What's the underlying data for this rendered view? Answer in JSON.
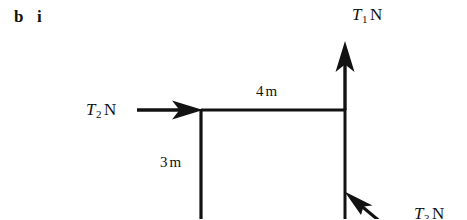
{
  "figure": {
    "part_label": {
      "part": "b",
      "roman": "i"
    },
    "background_color": "#ffffff",
    "ink_color": "#121212",
    "forces": [
      {
        "name": "T1",
        "symbol": "T",
        "subscript": "1",
        "unit": "N",
        "direction": "up",
        "arrow": {
          "x1": 345,
          "y1": 110,
          "x2": 345,
          "y2": 44
        },
        "label_position": {
          "x": 352,
          "y": 6
        }
      },
      {
        "name": "T2",
        "symbol": "T",
        "subscript": "2",
        "unit": "N",
        "direction": "right",
        "arrow": {
          "x1": 137,
          "y1": 110,
          "x2": 201,
          "y2": 110
        },
        "label_position": {
          "x": 86,
          "y": 101
        }
      },
      {
        "name": "T3",
        "symbol": "T",
        "subscript": "3",
        "unit": "N",
        "direction": "up-left",
        "arrow": {
          "x1": 392,
          "y1": 232,
          "x2": 345,
          "y2": 192
        },
        "label_position": {
          "x": 414,
          "y": 205
        }
      }
    ],
    "dimensions": [
      {
        "name": "top-horizontal",
        "value": "4",
        "unit": "m",
        "label": "4 m",
        "label_position": {
          "x": 256,
          "y": 84
        },
        "line": {
          "x1": 201,
          "y1": 110,
          "x2": 345,
          "y2": 110
        }
      },
      {
        "name": "left-vertical",
        "value": "3",
        "unit": "m",
        "label": "3 m",
        "label_position": {
          "x": 160,
          "y": 155
        },
        "line": {
          "x1": 201,
          "y1": 110,
          "x2": 201,
          "y2": 219
        }
      }
    ],
    "frame_lines": [
      {
        "name": "top-beam",
        "x1": 201,
        "y1": 110,
        "x2": 345,
        "y2": 110
      },
      {
        "name": "left-member",
        "x1": 201,
        "y1": 110,
        "x2": 201,
        "y2": 219
      },
      {
        "name": "right-member",
        "x1": 345,
        "y1": 110,
        "x2": 345,
        "y2": 219
      }
    ]
  }
}
